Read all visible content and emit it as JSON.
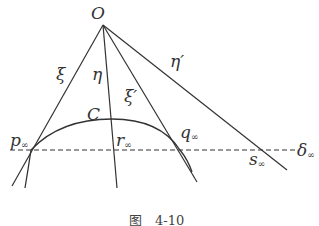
{
  "figure": {
    "caption": "图　4-10",
    "stroke_color": "#333333",
    "points": {
      "O": {
        "label": "O",
        "x": 103,
        "y": 25
      },
      "p_inf": {
        "label": "p",
        "sub": "∞",
        "x": 31,
        "y": 150
      },
      "r_inf": {
        "label": "r",
        "sub": "∞",
        "x": 115,
        "y": 150
      },
      "q_inf": {
        "label": "q",
        "sub": "∞",
        "x": 180,
        "y": 150
      },
      "s_inf": {
        "label": "s",
        "sub": "∞",
        "x": 262,
        "y": 150
      }
    },
    "lines": [
      {
        "name": "xi",
        "label": "ξ",
        "from": [
          103,
          25
        ],
        "to": [
          12,
          186
        ]
      },
      {
        "name": "eta",
        "label": "η",
        "from": [
          103,
          25
        ],
        "to": [
          117,
          188
        ]
      },
      {
        "name": "xi-prime",
        "label": "ξ′",
        "from": [
          103,
          25
        ],
        "to": [
          197,
          182
        ]
      },
      {
        "name": "eta-prime",
        "label": "η′",
        "from": [
          103,
          25
        ],
        "to": [
          287,
          170
        ]
      }
    ],
    "conic": {
      "label": "C"
    },
    "line_at_infinity": {
      "label": "δ",
      "sub": "∞",
      "style": "dashed",
      "y": 150
    }
  }
}
